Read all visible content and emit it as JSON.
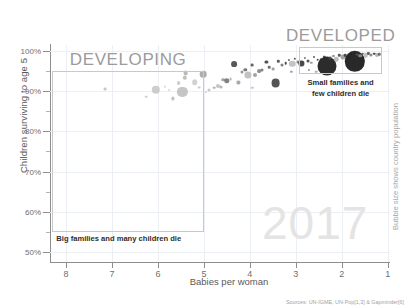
{
  "chart_data": {
    "type": "scatter",
    "title": "",
    "xlabel": "Babies per woman",
    "ylabel": "Children surviving to age 5",
    "right_label": "Bubble size shows country population",
    "year_watermark": "2017",
    "source": "Sources: UN-IGME, UN-Pop[1,3] & Gapminder[6]",
    "xlim": [
      8.35,
      0.95
    ],
    "ylim": [
      47.5,
      101.5
    ],
    "x_reversed": true,
    "grid": true,
    "legend": "none",
    "xticks": [
      8,
      7,
      6,
      5,
      4,
      3,
      2,
      1
    ],
    "xtick_labels": [
      "8",
      "7",
      "6",
      "5",
      "4",
      "3",
      "2",
      "1"
    ],
    "yticks": [
      50,
      60,
      70,
      80,
      90,
      100
    ],
    "ytick_labels": [
      "50%",
      "60%",
      "70%",
      "80%",
      "90%",
      "100%"
    ],
    "yticks_minor": [
      55,
      65,
      75,
      85,
      95
    ],
    "bubble_size_meaning": "country population",
    "annotations": [
      {
        "name": "developing",
        "title": "DEVELOPING",
        "caption": "Big families and many children die",
        "box_x": [
          8.3,
          5.0
        ],
        "box_y": [
          55,
          95
        ]
      },
      {
        "name": "developed",
        "title": "DEVELOPED",
        "caption_line1": "Small families and",
        "caption_line2": "few children die",
        "box_x": [
          2.93,
          1.12
        ],
        "box_y": [
          94.2,
          100.9
        ]
      }
    ],
    "points": [
      {
        "x": 7.15,
        "y": 90.5,
        "r": 1.4,
        "c": "#b9b9b9"
      },
      {
        "x": 6.25,
        "y": 88.6,
        "r": 1.3,
        "c": "#c4c4c4"
      },
      {
        "x": 6.05,
        "y": 90.3,
        "r": 4.2,
        "c": "#c2c2c2"
      },
      {
        "x": 5.85,
        "y": 91.1,
        "r": 1.2,
        "c": "#cccccc"
      },
      {
        "x": 5.68,
        "y": 88.2,
        "r": 1.6,
        "c": "#b0b0b0"
      },
      {
        "x": 5.55,
        "y": 92.1,
        "r": 1.9,
        "c": "#c0c0c0"
      },
      {
        "x": 5.47,
        "y": 89.8,
        "r": 5.1,
        "c": "#b8b8b8"
      },
      {
        "x": 5.42,
        "y": 93.4,
        "r": 2.2,
        "c": "#aeaeae"
      },
      {
        "x": 5.4,
        "y": 94.5,
        "r": 2.4,
        "c": "#a8a8a8"
      },
      {
        "x": 5.2,
        "y": 92.2,
        "r": 2.8,
        "c": "#c7c7c7"
      },
      {
        "x": 5.1,
        "y": 90.9,
        "r": 1.4,
        "c": "#bdbdbd"
      },
      {
        "x": 5.02,
        "y": 94.3,
        "r": 3.3,
        "c": "#9a9a9a"
      },
      {
        "x": 4.9,
        "y": 90.4,
        "r": 1.5,
        "c": "#bbbbbb"
      },
      {
        "x": 4.78,
        "y": 90.9,
        "r": 1.3,
        "c": "#9e9e9e"
      },
      {
        "x": 4.7,
        "y": 91.4,
        "r": 2.0,
        "c": "#b6b6b6"
      },
      {
        "x": 4.62,
        "y": 91.0,
        "r": 1.5,
        "c": "#a2a2a2"
      },
      {
        "x": 4.58,
        "y": 92.9,
        "r": 1.8,
        "c": "#8e8e8e"
      },
      {
        "x": 4.5,
        "y": 92.6,
        "r": 2.7,
        "c": "#616161"
      },
      {
        "x": 4.42,
        "y": 93.1,
        "r": 1.4,
        "c": "#a6a6a6"
      },
      {
        "x": 4.34,
        "y": 96.7,
        "r": 2.9,
        "c": "#2e2e2e"
      },
      {
        "x": 4.25,
        "y": 92.2,
        "r": 1.6,
        "c": "#949494"
      },
      {
        "x": 4.18,
        "y": 94.7,
        "r": 1.5,
        "c": "#7d7d7d"
      },
      {
        "x": 4.1,
        "y": 95.4,
        "r": 1.7,
        "c": "#565656"
      },
      {
        "x": 4.04,
        "y": 94.0,
        "r": 3.6,
        "c": "#b3b3b3"
      },
      {
        "x": 3.95,
        "y": 96.4,
        "r": 1.4,
        "c": "#3c3c3c"
      },
      {
        "x": 3.88,
        "y": 94.1,
        "r": 2.0,
        "c": "#8b8b8b"
      },
      {
        "x": 3.8,
        "y": 95.0,
        "r": 1.9,
        "c": "#737373"
      },
      {
        "x": 3.74,
        "y": 95.4,
        "r": 1.5,
        "c": "#606060"
      },
      {
        "x": 3.64,
        "y": 97.2,
        "r": 1.6,
        "c": "#272727"
      },
      {
        "x": 3.58,
        "y": 96.0,
        "r": 1.3,
        "c": "#4a4a4a"
      },
      {
        "x": 3.5,
        "y": 95.6,
        "r": 1.4,
        "c": "#8a8a8a"
      },
      {
        "x": 3.44,
        "y": 92.1,
        "r": 4.4,
        "c": "#2b2b2b"
      },
      {
        "x": 3.38,
        "y": 97.4,
        "r": 1.2,
        "c": "#353535"
      },
      {
        "x": 3.3,
        "y": 96.6,
        "r": 1.5,
        "c": "#5e5e5e"
      },
      {
        "x": 3.22,
        "y": 97.0,
        "r": 1.3,
        "c": "#1f1f1f"
      },
      {
        "x": 3.15,
        "y": 97.8,
        "r": 1.1,
        "c": "#444444"
      },
      {
        "x": 3.08,
        "y": 96.8,
        "r": 3.2,
        "c": "#b5b5b5"
      },
      {
        "x": 3.02,
        "y": 98.1,
        "r": 1.2,
        "c": "#303030"
      },
      {
        "x": 2.95,
        "y": 97.3,
        "r": 1.4,
        "c": "#6a6a6a"
      },
      {
        "x": 2.88,
        "y": 96.9,
        "r": 2.6,
        "c": "#1c1c1c"
      },
      {
        "x": 2.8,
        "y": 98.3,
        "r": 1.1,
        "c": "#555555"
      },
      {
        "x": 2.74,
        "y": 97.6,
        "r": 1.5,
        "c": "#2a2a2a"
      },
      {
        "x": 2.66,
        "y": 97.1,
        "r": 1.2,
        "c": "#888888"
      },
      {
        "x": 2.6,
        "y": 98.4,
        "r": 1.0,
        "c": "#3a3a3a"
      },
      {
        "x": 2.52,
        "y": 97.8,
        "r": 1.3,
        "c": "#202020"
      },
      {
        "x": 2.45,
        "y": 98.0,
        "r": 1.1,
        "c": "#6d6d6d"
      },
      {
        "x": 2.38,
        "y": 98.6,
        "r": 1.2,
        "c": "#2d2d2d"
      },
      {
        "x": 2.33,
        "y": 96.2,
        "r": 9.5,
        "c": "#1a1a1a"
      },
      {
        "x": 2.26,
        "y": 98.2,
        "r": 1.4,
        "c": "#4e4e4e"
      },
      {
        "x": 2.18,
        "y": 98.8,
        "r": 1.1,
        "c": "#7a7a7a"
      },
      {
        "x": 2.12,
        "y": 97.9,
        "r": 2.2,
        "c": "#adadad"
      },
      {
        "x": 2.05,
        "y": 98.9,
        "r": 1.2,
        "c": "#333333"
      },
      {
        "x": 1.98,
        "y": 98.4,
        "r": 2.5,
        "c": "#8f8f8f"
      },
      {
        "x": 1.92,
        "y": 99.0,
        "r": 1.3,
        "c": "#242424"
      },
      {
        "x": 1.86,
        "y": 98.6,
        "r": 2.0,
        "c": "#c0c0c0"
      },
      {
        "x": 1.8,
        "y": 99.2,
        "r": 1.1,
        "c": "#4c4c4c"
      },
      {
        "x": 1.72,
        "y": 97.4,
        "r": 10.2,
        "c": "#171717"
      },
      {
        "x": 1.66,
        "y": 99.1,
        "r": 1.4,
        "c": "#5b5b5b"
      },
      {
        "x": 1.6,
        "y": 98.8,
        "r": 1.8,
        "c": "#9c9c9c"
      },
      {
        "x": 1.54,
        "y": 99.3,
        "r": 1.2,
        "c": "#2f2f2f"
      },
      {
        "x": 1.48,
        "y": 99.0,
        "r": 2.3,
        "c": "#b1b1b1"
      },
      {
        "x": 1.42,
        "y": 99.4,
        "r": 1.1,
        "c": "#3e3e3e"
      },
      {
        "x": 1.36,
        "y": 99.1,
        "r": 1.6,
        "c": "#6e6e6e"
      },
      {
        "x": 1.3,
        "y": 99.3,
        "r": 1.3,
        "c": "#222222"
      },
      {
        "x": 1.24,
        "y": 98.9,
        "r": 2.0,
        "c": "#a4a4a4"
      },
      {
        "x": 1.18,
        "y": 99.2,
        "r": 1.2,
        "c": "#515151"
      },
      {
        "x": 3.95,
        "y": 90.8,
        "r": 1.2,
        "c": "#b7b7b7"
      },
      {
        "x": 4.95,
        "y": 89.9,
        "r": 1.1,
        "c": "#c9c9c9"
      },
      {
        "x": 5.75,
        "y": 90.2,
        "r": 1.0,
        "c": "#d0d0d0"
      },
      {
        "x": 2.55,
        "y": 94.9,
        "r": 1.3,
        "c": "#9d9d9d"
      },
      {
        "x": 2.72,
        "y": 95.3,
        "r": 1.1,
        "c": "#787878"
      },
      {
        "x": 3.1,
        "y": 94.9,
        "r": 1.2,
        "c": "#8c8c8c"
      }
    ]
  }
}
